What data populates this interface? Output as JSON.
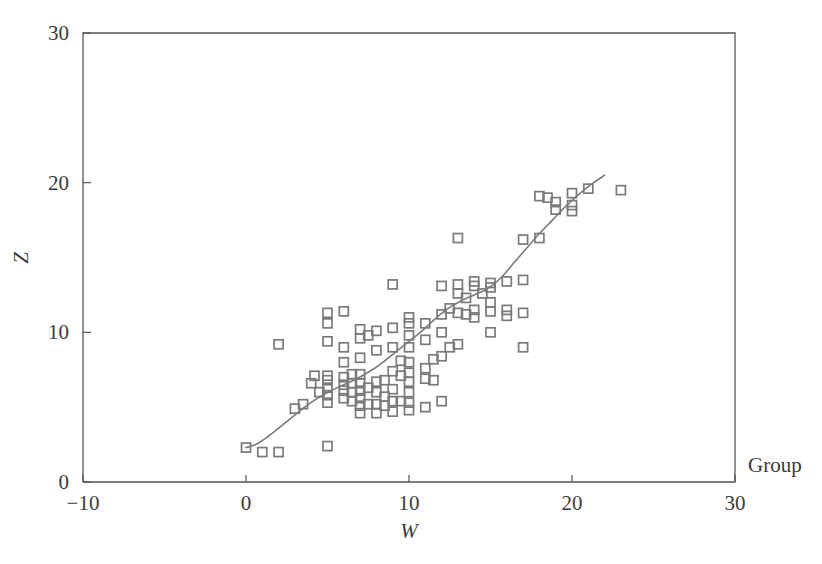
{
  "chart_data": {
    "type": "scatter",
    "title": "",
    "xlabel": "W",
    "ylabel": "Z",
    "xlim": [
      -10,
      30
    ],
    "ylim": [
      0,
      30
    ],
    "xticks": [
      -10,
      0,
      10,
      20,
      30
    ],
    "yticks": [
      0,
      10,
      20,
      30
    ],
    "xtick_labels": [
      "−10",
      "0",
      "10",
      "20",
      "30"
    ],
    "ytick_labels": [
      "0",
      "10",
      "20",
      "30"
    ],
    "grid": false,
    "legend": {
      "title": "Group",
      "position": "right"
    },
    "marker": {
      "shape": "square",
      "fill": "none",
      "edge_color": "#7a7a7a",
      "size": 9
    },
    "axis_color": "#555555",
    "series": [
      {
        "name": "Group",
        "marker_color": "#7a7a7a",
        "points": [
          [
            0.0,
            2.3
          ],
          [
            1.0,
            2.0
          ],
          [
            2.0,
            2.0
          ],
          [
            2.0,
            9.2
          ],
          [
            3.0,
            4.9
          ],
          [
            3.5,
            5.2
          ],
          [
            4.0,
            6.6
          ],
          [
            4.2,
            7.1
          ],
          [
            4.5,
            6.0
          ],
          [
            5.0,
            2.4
          ],
          [
            5.0,
            5.3
          ],
          [
            5.0,
            5.8
          ],
          [
            5.0,
            6.3
          ],
          [
            5.0,
            6.8
          ],
          [
            5.0,
            7.1
          ],
          [
            5.0,
            9.4
          ],
          [
            5.0,
            10.6
          ],
          [
            5.0,
            11.3
          ],
          [
            6.0,
            5.6
          ],
          [
            6.0,
            6.1
          ],
          [
            6.0,
            6.5
          ],
          [
            6.0,
            7.0
          ],
          [
            6.0,
            8.0
          ],
          [
            6.0,
            9.0
          ],
          [
            6.0,
            11.4
          ],
          [
            6.5,
            5.4
          ],
          [
            6.5,
            6.0
          ],
          [
            6.5,
            6.6
          ],
          [
            6.5,
            7.2
          ],
          [
            7.0,
            4.6
          ],
          [
            7.0,
            5.1
          ],
          [
            7.0,
            5.6
          ],
          [
            7.0,
            6.1
          ],
          [
            7.0,
            6.6
          ],
          [
            7.0,
            7.2
          ],
          [
            7.0,
            8.3
          ],
          [
            7.0,
            9.6
          ],
          [
            7.0,
            10.2
          ],
          [
            7.5,
            5.2
          ],
          [
            7.5,
            6.3
          ],
          [
            7.5,
            9.8
          ],
          [
            8.0,
            4.6
          ],
          [
            8.0,
            5.2
          ],
          [
            8.0,
            6.0
          ],
          [
            8.0,
            6.7
          ],
          [
            8.0,
            8.8
          ],
          [
            8.0,
            10.1
          ],
          [
            8.5,
            5.1
          ],
          [
            8.5,
            5.7
          ],
          [
            8.5,
            6.8
          ],
          [
            9.0,
            4.7
          ],
          [
            9.0,
            5.4
          ],
          [
            9.0,
            6.2
          ],
          [
            9.0,
            7.4
          ],
          [
            9.0,
            9.0
          ],
          [
            9.0,
            10.3
          ],
          [
            9.0,
            13.2
          ],
          [
            9.5,
            5.4
          ],
          [
            9.5,
            7.1
          ],
          [
            9.5,
            8.1
          ],
          [
            10.0,
            4.8
          ],
          [
            10.0,
            5.3
          ],
          [
            10.0,
            6.0
          ],
          [
            10.0,
            6.7
          ],
          [
            10.0,
            7.3
          ],
          [
            10.0,
            8.0
          ],
          [
            10.0,
            9.0
          ],
          [
            10.0,
            9.8
          ],
          [
            10.0,
            10.6
          ],
          [
            10.0,
            11.0
          ],
          [
            11.0,
            5.0
          ],
          [
            11.0,
            6.9
          ],
          [
            11.0,
            7.6
          ],
          [
            11.0,
            9.5
          ],
          [
            11.0,
            10.6
          ],
          [
            11.5,
            6.8
          ],
          [
            11.5,
            8.2
          ],
          [
            12.0,
            5.4
          ],
          [
            12.0,
            8.4
          ],
          [
            12.0,
            10.0
          ],
          [
            12.0,
            11.2
          ],
          [
            12.0,
            13.1
          ],
          [
            12.5,
            9.0
          ],
          [
            12.5,
            11.6
          ],
          [
            13.0,
            9.2
          ],
          [
            13.0,
            11.3
          ],
          [
            13.0,
            12.6
          ],
          [
            13.0,
            13.2
          ],
          [
            13.0,
            16.3
          ],
          [
            13.5,
            11.2
          ],
          [
            13.5,
            12.3
          ],
          [
            14.0,
            11.0
          ],
          [
            14.0,
            11.5
          ],
          [
            14.0,
            13.1
          ],
          [
            14.0,
            13.4
          ],
          [
            14.5,
            12.6
          ],
          [
            15.0,
            10.0
          ],
          [
            15.0,
            11.4
          ],
          [
            15.0,
            12.0
          ],
          [
            15.0,
            13.0
          ],
          [
            15.0,
            13.3
          ],
          [
            16.0,
            11.1
          ],
          [
            16.0,
            11.5
          ],
          [
            16.0,
            13.4
          ],
          [
            17.0,
            9.0
          ],
          [
            17.0,
            11.3
          ],
          [
            17.0,
            13.5
          ],
          [
            17.0,
            16.2
          ],
          [
            18.0,
            16.3
          ],
          [
            18.0,
            19.1
          ],
          [
            18.5,
            19.0
          ],
          [
            19.0,
            18.2
          ],
          [
            19.0,
            18.7
          ],
          [
            20.0,
            18.1
          ],
          [
            20.0,
            18.5
          ],
          [
            20.0,
            19.3
          ],
          [
            21.0,
            19.6
          ],
          [
            23.0,
            19.5
          ]
        ]
      }
    ],
    "fit_line": {
      "name": "smoothed-trend",
      "color": "#7a7a7a",
      "width": 1.6,
      "points": [
        [
          0.0,
          2.3
        ],
        [
          0.6,
          2.5
        ],
        [
          1.3,
          3.0
        ],
        [
          2.0,
          3.6
        ],
        [
          2.8,
          4.3
        ],
        [
          3.6,
          5.0
        ],
        [
          4.4,
          5.6
        ],
        [
          5.2,
          6.1
        ],
        [
          6.0,
          6.5
        ],
        [
          6.8,
          6.9
        ],
        [
          7.6,
          7.4
        ],
        [
          8.4,
          8.0
        ],
        [
          9.2,
          8.7
        ],
        [
          10.0,
          9.4
        ],
        [
          10.8,
          10.1
        ],
        [
          11.6,
          10.9
        ],
        [
          12.4,
          11.6
        ],
        [
          13.2,
          12.1
        ],
        [
          14.0,
          12.5
        ],
        [
          14.8,
          12.9
        ],
        [
          15.6,
          13.6
        ],
        [
          16.4,
          14.6
        ],
        [
          17.2,
          15.6
        ],
        [
          18.0,
          16.6
        ],
        [
          18.8,
          17.5
        ],
        [
          19.6,
          18.4
        ],
        [
          20.4,
          19.2
        ],
        [
          21.2,
          19.9
        ],
        [
          22.0,
          20.5
        ]
      ]
    }
  }
}
